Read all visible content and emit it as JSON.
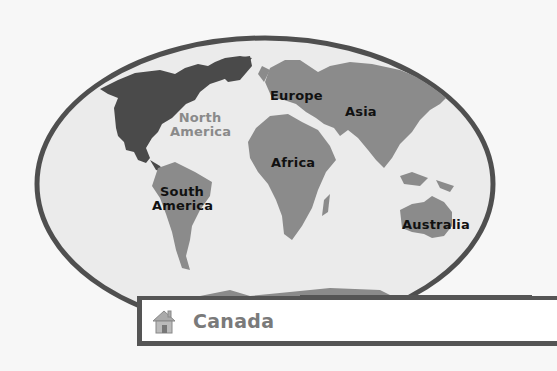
{
  "map": {
    "highlighted_continent": "North America",
    "colors": {
      "background": "#f7f7f7",
      "ocean": "#ebebeb",
      "border": "#4f4f4f",
      "continent": "#8b8b8b",
      "highlight": "#4a4a4a"
    },
    "labels": {
      "north_america": "North\nAmerica",
      "north_america_l1": "North",
      "north_america_l2": "America",
      "south_america_l1": "South",
      "south_america_l2": "America",
      "europe": "Europe",
      "asia": "Asia",
      "africa": "Africa",
      "australia": "Australia"
    }
  },
  "answer_bar": {
    "icon": "home-icon",
    "text": "Canada"
  }
}
